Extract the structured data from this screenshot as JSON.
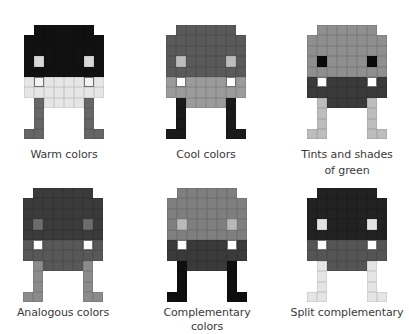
{
  "figures": [
    {
      "id": "warm",
      "label": "Warm colors",
      "position": {
        "x": 4,
        "y": 25
      },
      "colors": {
        "head": "#111111",
        "eye": "#d8d8d8",
        "band": "#e6e6e6",
        "tooth": "#f3f3f3",
        "body": "#e6e6e6",
        "legs": "#666666"
      }
    },
    {
      "id": "cool",
      "label": "Cool colors",
      "position": {
        "x": 146,
        "y": 25
      },
      "colors": {
        "head": "#5a5a5a",
        "eye": "#bdbdbd",
        "band": "#9b9b9b",
        "tooth": "#ffffff",
        "body": "#9b9b9b",
        "legs": "#1a1a1a"
      }
    },
    {
      "id": "tints-shades-green",
      "label": "Tints and shades of green",
      "label_lines": [
        "Tints and shades",
        "of green"
      ],
      "position": {
        "x": 287,
        "y": 25
      },
      "colors": {
        "head": "#8f8f8f",
        "eye": "#0a0a0a",
        "band": "#3a3a3a",
        "tooth": "#ffffff",
        "body": "#3a3a3a",
        "legs": "#bdbdbd"
      }
    },
    {
      "id": "analogous",
      "label": "Analogous colors",
      "position": {
        "x": 3,
        "y": 188
      },
      "colors": {
        "head": "#3b3b3b",
        "eye": "#6c6c6c",
        "band": "#585858",
        "tooth": "#ffffff",
        "body": "#585858",
        "legs": "#8b8b8b"
      }
    },
    {
      "id": "complementary",
      "label": "Complementary colors",
      "position": {
        "x": 147,
        "y": 188
      },
      "colors": {
        "head": "#7f7f7f",
        "eye": "#b9b9b9",
        "band": "#3a3a3a",
        "tooth": "#ffffff",
        "body": "#3a3a3a",
        "legs": "#0f0f0f"
      }
    },
    {
      "id": "split-complementary",
      "label": "Split complementary",
      "position": {
        "x": 287,
        "y": 188
      },
      "colors": {
        "head": "#222222",
        "eye": "#e2e2e2",
        "band": "#555555",
        "tooth": "#ffffff",
        "body": "#555555",
        "legs": "#e5e5e5"
      }
    }
  ],
  "sprite_grid": {
    "cols": 8,
    "rows": 11,
    "map": [
      "-HHHHHH-",
      "HHHHHHHH",
      "HHHHHHHH",
      "HEHHHHEH",
      "HHHHHHHH",
      "BTBBBBTB",
      "BBBBBBBB",
      "-LDDDDL-",
      "-L----L-",
      "-L----L-",
      "LL----LL"
    ],
    "legend": {
      "H": "head",
      "E": "eye",
      "B": "band",
      "T": "tooth",
      "D": "body",
      "L": "legs",
      "-": "empty"
    }
  }
}
